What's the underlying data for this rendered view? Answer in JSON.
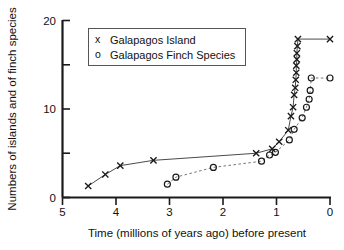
{
  "chart_data": {
    "type": "scatter",
    "title": "",
    "xlabel": "Time (millions of years ago) before present",
    "ylabel": "Numbers of islands and of finch species",
    "xlim": [
      5,
      0
    ],
    "ylim": [
      0,
      20
    ],
    "x_ticks": [
      5,
      4,
      3,
      2,
      1,
      0
    ],
    "x_tick_labels": [
      "5",
      "4",
      "3",
      "2",
      "1",
      "0"
    ],
    "y_ticks": [
      0,
      5,
      10,
      15,
      20
    ],
    "y_tick_labels": [
      "0",
      "",
      "10",
      "",
      "20"
    ],
    "y_major_labeled": [
      0,
      10,
      20
    ],
    "y_minor_ticks": [
      5,
      15
    ],
    "x_axis_reversed": true,
    "grid": false,
    "legend_position": "upper-left-inside",
    "series": [
      {
        "name": "Galapagos Island",
        "marker": "x",
        "linestyle": "solid",
        "x": [
          4.52,
          4.2,
          3.92,
          3.3,
          1.38,
          1.08,
          0.95,
          0.78,
          0.73,
          0.69,
          0.67,
          0.65,
          0.64,
          0.63,
          0.63,
          0.62,
          0.62,
          0.61,
          0.6,
          0.0
        ],
        "y": [
          1.3,
          2.6,
          3.6,
          4.2,
          5.0,
          5.5,
          6.3,
          7.6,
          9.2,
          10.2,
          11.6,
          12.4,
          13.3,
          14.1,
          14.9,
          15.6,
          16.3,
          17.1,
          17.9,
          17.9
        ]
      },
      {
        "name": "Galapagos Finch Species",
        "marker": "o",
        "linestyle": "dashed",
        "x": [
          3.04,
          2.88,
          2.18,
          1.28,
          1.13,
          1.02,
          0.76,
          0.67,
          0.52,
          0.44,
          0.39,
          0.37,
          0.35,
          0.0
        ],
        "y": [
          1.5,
          2.3,
          3.4,
          4.1,
          4.8,
          5.1,
          6.5,
          7.7,
          9.0,
          10.2,
          11.1,
          12.1,
          13.5,
          13.5
        ]
      }
    ],
    "legend_entries": [
      {
        "symbol": "x",
        "label": "Galapagos Island"
      },
      {
        "symbol": "o",
        "label": "Galapagos Finch Species"
      }
    ]
  }
}
